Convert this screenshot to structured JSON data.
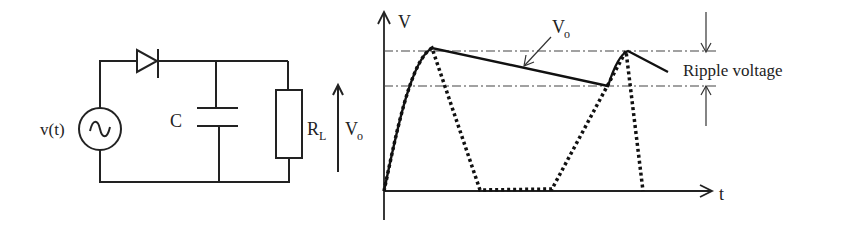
{
  "circuit": {
    "source_label": "v(t)",
    "capacitor_label": "C",
    "resistor_label_main": "R",
    "resistor_label_sub": "L",
    "output_label_main": "V",
    "output_label_sub": "o"
  },
  "graph": {
    "y_axis_label": "V",
    "x_axis_label": "t",
    "output_annotation_main": "V",
    "output_annotation_sub": "o",
    "ripple_label": "Ripple voltage"
  },
  "colors": {
    "ink": "#222222",
    "background": "#ffffff"
  }
}
